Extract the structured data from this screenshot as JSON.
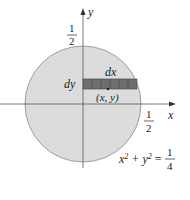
{
  "diagram": {
    "axes": {
      "x_label": "x",
      "y_label": "y"
    },
    "ticks": {
      "y_top": {
        "num": "1",
        "den": "2"
      },
      "x_right": {
        "num": "1",
        "den": "2"
      }
    },
    "strip": {
      "dx_label": "dx",
      "dy_label": "dy",
      "point_label": "(x, y)",
      "cells": 6
    },
    "equation": {
      "lhs": "x² + y² =",
      "num": "1",
      "den": "4"
    },
    "colors": {
      "disk_fill": "#dcdcdc",
      "disk_stroke": "#888888",
      "strip_fill": "#6e6e6e",
      "axis": "#555555"
    }
  }
}
